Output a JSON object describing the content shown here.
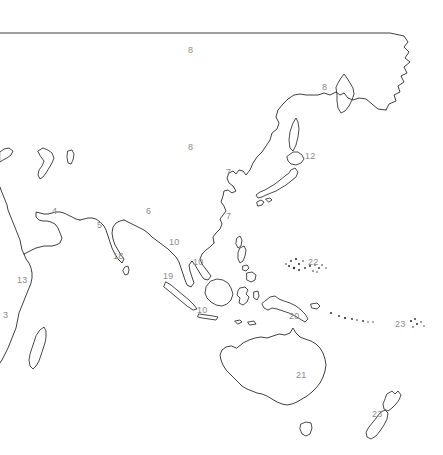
{
  "map": {
    "title": "Asia-Pacific outline map with numbered regions",
    "width": 443,
    "height": 455,
    "background_color": "#ffffff",
    "coastline_color": "#2b2b2b",
    "label_color": "#8c8c8c",
    "label_font_size_px": 9,
    "labels": [
      {
        "id": "label-8-north-asia",
        "text": "8",
        "x": 188,
        "y": 46,
        "region_hint": "northern-asia"
      },
      {
        "id": "label-8-kamchatka",
        "text": "8",
        "x": 322,
        "y": 83,
        "region_hint": "russian-far-east"
      },
      {
        "id": "label-8-central-asia",
        "text": "8",
        "x": 188,
        "y": 143,
        "region_hint": "central-asia"
      },
      {
        "id": "label-12-japan",
        "text": "12",
        "x": 305,
        "y": 152,
        "region_hint": "japan"
      },
      {
        "id": "label-7-north-korea",
        "text": "7",
        "x": 226,
        "y": 168,
        "region_hint": "korea-north"
      },
      {
        "id": "label-7-south-korea",
        "text": "7",
        "x": 226,
        "y": 212,
        "region_hint": "korea-south"
      },
      {
        "id": "label-4-middle-east",
        "text": "4",
        "x": 52,
        "y": 207,
        "region_hint": "middle-east"
      },
      {
        "id": "label-6-china",
        "text": "6",
        "x": 146,
        "y": 207,
        "region_hint": "china"
      },
      {
        "id": "label-5-pakistan",
        "text": "5",
        "x": 97,
        "y": 221,
        "region_hint": "pakistan"
      },
      {
        "id": "label-10-indochina-n",
        "text": "10",
        "x": 169,
        "y": 238,
        "region_hint": "indochina-north"
      },
      {
        "id": "label-18-india",
        "text": "18",
        "x": 113,
        "y": 252,
        "region_hint": "india"
      },
      {
        "id": "label-10-indochina-s",
        "text": "10",
        "x": 193,
        "y": 258,
        "region_hint": "indochina-south"
      },
      {
        "id": "label-22-micronesia",
        "text": "22",
        "x": 308,
        "y": 258,
        "region_hint": "micronesia"
      },
      {
        "id": "label-19-malaysia",
        "text": "19",
        "x": 163,
        "y": 272,
        "region_hint": "malaysia"
      },
      {
        "id": "label-13-east-africa",
        "text": "13",
        "x": 17,
        "y": 276,
        "region_hint": "east-africa"
      },
      {
        "id": "label-20-new-guinea",
        "text": "20",
        "x": 289,
        "y": 312,
        "region_hint": "new-guinea"
      },
      {
        "id": "label-10-indonesia",
        "text": "10",
        "x": 197,
        "y": 306,
        "region_hint": "indonesia"
      },
      {
        "id": "label-3-africa",
        "text": "3",
        "x": 3,
        "y": 311,
        "region_hint": "southern-africa"
      },
      {
        "id": "label-23-pacific-islands",
        "text": "23",
        "x": 395,
        "y": 320,
        "region_hint": "pacific-islands"
      },
      {
        "id": "label-21-australia",
        "text": "21",
        "x": 296,
        "y": 371,
        "region_hint": "australia"
      },
      {
        "id": "label-23-new-zealand",
        "text": "23",
        "x": 372,
        "y": 410,
        "region_hint": "new-zealand"
      }
    ],
    "island_dot_groups": [
      {
        "name": "micronesia-dots",
        "dots": [
          {
            "x": 291,
            "y": 261,
            "r": 0.9
          },
          {
            "x": 296,
            "y": 259,
            "r": 1.1
          },
          {
            "x": 299,
            "y": 264,
            "r": 1.0
          },
          {
            "x": 303,
            "y": 261,
            "r": 0.8
          },
          {
            "x": 289,
            "y": 266,
            "r": 1.0
          },
          {
            "x": 294,
            "y": 268,
            "r": 1.2
          },
          {
            "x": 299,
            "y": 270,
            "r": 1.0
          },
          {
            "x": 305,
            "y": 268,
            "r": 0.9
          },
          {
            "x": 310,
            "y": 266,
            "r": 1.0
          },
          {
            "x": 315,
            "y": 265,
            "r": 0.8
          },
          {
            "x": 319,
            "y": 268,
            "r": 0.9
          },
          {
            "x": 322,
            "y": 265,
            "r": 0.8
          },
          {
            "x": 326,
            "y": 268,
            "r": 0.7
          },
          {
            "x": 313,
            "y": 271,
            "r": 0.8
          },
          {
            "x": 317,
            "y": 272,
            "r": 0.7
          },
          {
            "x": 286,
            "y": 264,
            "r": 0.8
          }
        ]
      },
      {
        "name": "melanesia-dots",
        "dots": [
          {
            "x": 331,
            "y": 313,
            "r": 1.0
          },
          {
            "x": 339,
            "y": 316,
            "r": 0.9
          },
          {
            "x": 345,
            "y": 318,
            "r": 1.1
          },
          {
            "x": 352,
            "y": 319,
            "r": 0.9
          },
          {
            "x": 357,
            "y": 320,
            "r": 0.8
          },
          {
            "x": 363,
            "y": 321,
            "r": 0.9
          },
          {
            "x": 368,
            "y": 322,
            "r": 0.7
          },
          {
            "x": 373,
            "y": 322,
            "r": 0.7
          }
        ]
      },
      {
        "name": "fiji-dots",
        "dots": [
          {
            "x": 411,
            "y": 321,
            "r": 1.1
          },
          {
            "x": 415,
            "y": 319,
            "r": 0.9
          },
          {
            "x": 417,
            "y": 324,
            "r": 1.0
          },
          {
            "x": 421,
            "y": 322,
            "r": 0.8
          },
          {
            "x": 413,
            "y": 327,
            "r": 0.8
          },
          {
            "x": 424,
            "y": 326,
            "r": 0.7
          }
        ]
      }
    ]
  }
}
